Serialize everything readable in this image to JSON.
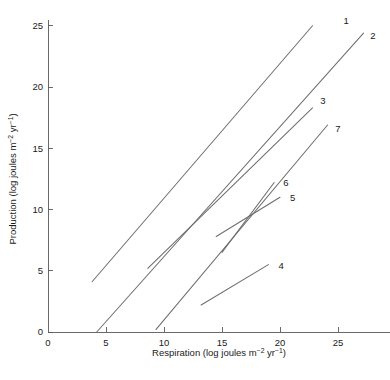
{
  "chart_data": {
    "type": "line",
    "title": "",
    "subtitle": "",
    "xlabel_parts": {
      "lead": "Respiration (log joules m",
      "sup1": "−2",
      "mid": " yr",
      "sup2": "−1",
      "tail": ")"
    },
    "ylabel_parts": {
      "lead": "Production (log joules m",
      "sup1": "−2",
      "mid": " yr",
      "sup2": "−1",
      "tail": ")"
    },
    "xlabel": "Respiration (log joules m−2 yr−1)",
    "ylabel": "Production (log joules m−2 yr−1)",
    "xlim": [
      0,
      29.5
    ],
    "ylim": [
      0,
      25.5
    ],
    "xticks": [
      0,
      5,
      10,
      15,
      20,
      25
    ],
    "xticklabels": [
      "0",
      "5",
      "10",
      "15",
      "20",
      "25"
    ],
    "yticks": [
      0,
      5,
      10,
      15,
      20,
      25
    ],
    "yticklabels": [
      "0",
      "5",
      "10",
      "15",
      "20",
      "25"
    ],
    "grid": false,
    "legend": "inline-endpoint-labels",
    "line_color": "#6e6e6e",
    "axis_color": "#5a5a5a",
    "background": "#ffffff",
    "series": [
      {
        "name": "1",
        "label": "1",
        "x": [
          3.8,
          22.8
        ],
        "y": [
          4.1,
          25.0
        ],
        "label_x": 25.7,
        "label_y": 25.4
      },
      {
        "name": "2",
        "label": "2",
        "x": [
          4.2,
          27.2
        ],
        "y": [
          0.0,
          24.4
        ],
        "label_x": 28.0,
        "label_y": 24.2
      },
      {
        "name": "3",
        "label": "3",
        "x": [
          8.6,
          22.8
        ],
        "y": [
          5.2,
          18.3
        ],
        "label_x": 23.7,
        "label_y": 18.9
      },
      {
        "name": "4",
        "label": "4",
        "x": [
          13.2,
          19.0
        ],
        "y": [
          2.2,
          5.5
        ],
        "label_x": 20.1,
        "label_y": 5.4
      },
      {
        "name": "5",
        "label": "5",
        "x": [
          14.5,
          20.0
        ],
        "y": [
          7.8,
          11.0
        ],
        "label_x": 21.1,
        "label_y": 11.0
      },
      {
        "name": "6",
        "label": "6",
        "x": [
          15.0,
          19.5
        ],
        "y": [
          6.5,
          12.2
        ],
        "label_x": 20.5,
        "label_y": 12.2
      },
      {
        "name": "7",
        "label": "7",
        "x": [
          9.3,
          24.1
        ],
        "y": [
          0.2,
          16.9
        ],
        "label_x": 25.0,
        "label_y": 16.6
      }
    ]
  }
}
